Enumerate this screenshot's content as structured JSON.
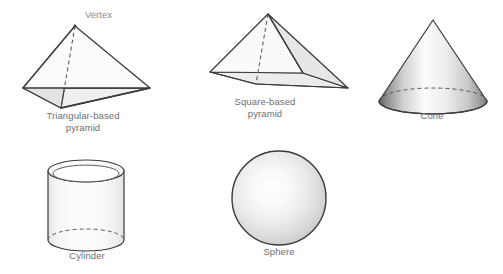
{
  "figure": {
    "background_color": "#ffffff",
    "width": 503,
    "height": 274
  },
  "style": {
    "outline_color": "#3a3a3a",
    "label_color": "#6e6e72",
    "callout_color": "#8a8a8e",
    "face_light": "#f2f2f2",
    "face_shaded": "#e3e3e3",
    "face_base": "#ececec",
    "gradient_dark": "#6b6b6b",
    "gradient_light": "#fdfdfd"
  },
  "shapes": [
    {
      "id": "triangular-based-pyramid",
      "label": "Triangular-based\npyramid",
      "annotation": "Vertex",
      "faces": 4,
      "base": "triangle",
      "has_hidden_edge": true
    },
    {
      "id": "square-based-pyramid",
      "label": "Square-based\npyramid",
      "faces": 5,
      "base": "square",
      "has_hidden_edge": true
    },
    {
      "id": "cone",
      "label": "Cone",
      "faces": 2,
      "base": "circle",
      "has_hidden_edge": true
    },
    {
      "id": "cylinder",
      "label": "Cylinder",
      "faces": 3,
      "base": "circle",
      "has_hidden_edge": true
    },
    {
      "id": "sphere",
      "label": "Sphere",
      "faces": 1,
      "base": "none",
      "has_hidden_edge": false
    }
  ],
  "labels": {
    "vertex": "Vertex",
    "triangular_pyramid": "Triangular-based\npyramid",
    "square_pyramid": "Square-based\npyramid",
    "cone": "Cone",
    "cylinder": "Cylinder",
    "sphere": "Sphere"
  }
}
